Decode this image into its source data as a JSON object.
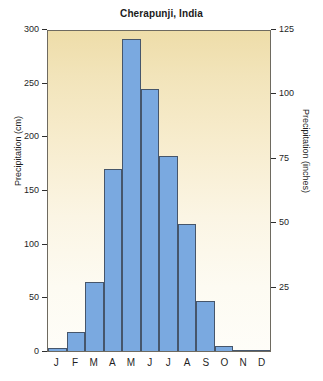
{
  "chart_data": {
    "type": "bar",
    "title": "Cherapunji, India",
    "xlabel": "",
    "ylabel": "Precipitation (cm)",
    "ylabel_secondary": "Precipitation (inches)",
    "categories": [
      "J",
      "F",
      "M",
      "A",
      "M",
      "J",
      "J",
      "A",
      "S",
      "O",
      "N",
      "D"
    ],
    "category_names": [
      "January",
      "February",
      "March",
      "April",
      "May",
      "June",
      "July",
      "August",
      "September",
      "October",
      "November",
      "December"
    ],
    "values": [
      3,
      18,
      64,
      170,
      291,
      244,
      182,
      118,
      47,
      5,
      1,
      0
    ],
    "value_unit": "cm",
    "values_inches": [
      1,
      7,
      27,
      71,
      121,
      101,
      76,
      49,
      20,
      2,
      0.4,
      0
    ],
    "ylim": [
      0,
      300
    ],
    "yticks": [
      0,
      50,
      100,
      150,
      200,
      250,
      300
    ],
    "ylim_secondary": [
      0,
      125
    ],
    "yticks_secondary": [
      0,
      25,
      50,
      75,
      100,
      125
    ],
    "grid": false,
    "legend": false,
    "bar_color": "#7aa9e0",
    "bar_edge_color": "#46566b",
    "plot_bg_top": "#eedda9",
    "plot_bg_bottom": "#fefdf8",
    "frame_color": "#6e6a60"
  },
  "axis_left": {
    "title": "Precipitation (cm)",
    "ticks": [
      {
        "value": 300,
        "label": "300"
      },
      {
        "value": 250,
        "label": "250"
      },
      {
        "value": 200,
        "label": "200"
      },
      {
        "value": 150,
        "label": "150"
      },
      {
        "value": 100,
        "label": "100"
      },
      {
        "value": 50,
        "label": "50"
      },
      {
        "value": 0,
        "label": "0"
      }
    ]
  },
  "axis_right": {
    "title": "Precipitation (inches)",
    "ticks": [
      {
        "value": 125,
        "label": "125"
      },
      {
        "value": 100,
        "label": "100"
      },
      {
        "value": 75,
        "label": "75"
      },
      {
        "value": 50,
        "label": "50"
      },
      {
        "value": 25,
        "label": "25"
      }
    ]
  }
}
